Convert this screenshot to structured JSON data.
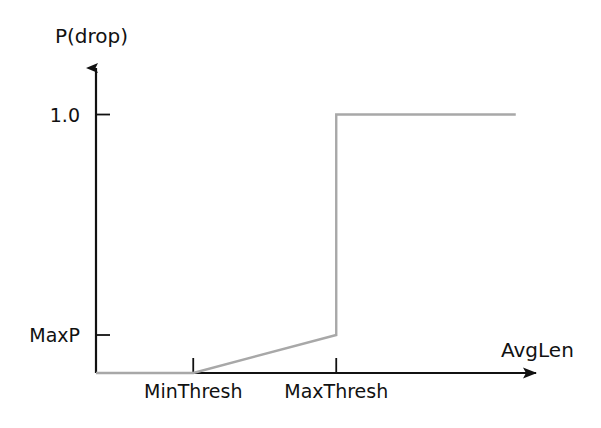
{
  "chart_data": {
    "type": "line",
    "title": "",
    "subtitle": "",
    "xlabel": "AvgLen",
    "ylabel": "P(drop)",
    "grid": false,
    "legend": null,
    "axis_style": "arrow-axes",
    "xlim": [
      0,
      1
    ],
    "ylim": [
      0,
      1.18
    ],
    "x_ticks": [
      {
        "label": "MinThresh",
        "value": 0.221
      },
      {
        "label": "MaxThresh",
        "value": 0.546
      }
    ],
    "y_ticks": [
      {
        "label": "MaxP",
        "value": 0.147
      },
      {
        "label": "1.0",
        "value": 1.0
      }
    ],
    "series": [
      {
        "name": "drop probability",
        "color": "#a8a8a8",
        "points": [
          {
            "x": 0.0,
            "y": 0.0
          },
          {
            "x": 0.221,
            "y": 0.0
          },
          {
            "x": 0.546,
            "y": 0.147
          },
          {
            "x": 0.546,
            "y": 1.0
          },
          {
            "x": 0.954,
            "y": 1.0
          }
        ]
      }
    ],
    "annotations": []
  },
  "labels": {
    "y_axis": "P(drop)",
    "x_axis": "AvgLen",
    "y_tick_high": "1.0",
    "y_tick_maxp": "MaxP",
    "x_tick_min": "MinThresh",
    "x_tick_max": "MaxThresh"
  },
  "colors": {
    "background": "#ffffff",
    "axis": "#111111",
    "curve": "#a8a8a8",
    "text": "#111111"
  }
}
